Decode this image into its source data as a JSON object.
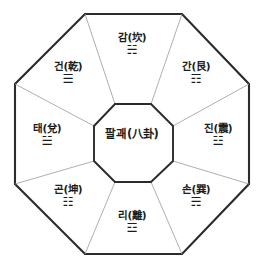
{
  "diagram": {
    "title_center": "팔괘(八卦)",
    "background_color": "#ffffff",
    "outline_color": "#2b2b2b",
    "spoke_color": "#9a9a9a",
    "text_color": "#1c1c1c",
    "shape": "octagon",
    "sector_count": 8,
    "sectors": [
      {
        "position": "top",
        "label": "감(坎)",
        "trigram": "☵",
        "x": 132,
        "y": 44
      },
      {
        "position": "top-left",
        "label": "건(乾)",
        "trigram": "☰",
        "x": 68,
        "y": 73
      },
      {
        "position": "top-right",
        "label": "간(艮)",
        "trigram": "☶",
        "x": 196,
        "y": 73
      },
      {
        "position": "left",
        "label": "태(兌)",
        "trigram": "☱",
        "x": 47,
        "y": 135
      },
      {
        "position": "right",
        "label": "진(震)",
        "trigram": "☳",
        "x": 218,
        "y": 135
      },
      {
        "position": "bottom-left",
        "label": "곤(坤)",
        "trigram": "☷",
        "x": 68,
        "y": 196
      },
      {
        "position": "bottom-right",
        "label": "손(巽)",
        "trigram": "☴",
        "x": 196,
        "y": 196
      },
      {
        "position": "bottom",
        "label": "리(離)",
        "trigram": "☲",
        "x": 132,
        "y": 222
      }
    ]
  },
  "geometry": {
    "outer_points": "85,14 182,14 249,84 249,184 182,254 85,254 15,184 15,84",
    "inner_points": "115,104 151,104 173,126 173,161 151,182 115,182 94,161 94,126",
    "spokes": [
      "115,104 85,14",
      "151,104 182,14",
      "173,126 249,84",
      "173,161 249,184",
      "151,182 182,254",
      "115,182 85,254",
      "94,161 15,184",
      "94,126 15,84"
    ]
  }
}
